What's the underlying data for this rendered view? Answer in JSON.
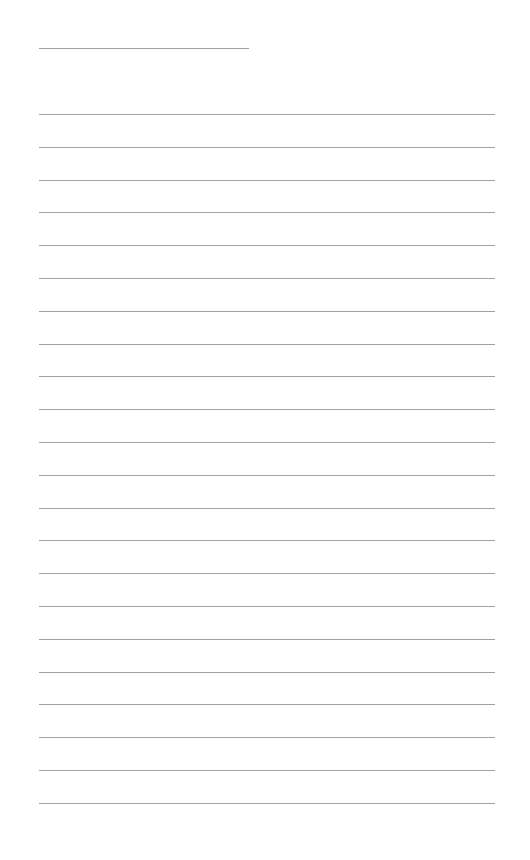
{
  "page": {
    "type": "lined-paper",
    "background_color": "#ffffff",
    "line_color": "#a0a0a0",
    "header_line": {
      "x": 39,
      "y": 48,
      "width": 210
    },
    "ruled_lines": {
      "x": 39,
      "width": 456,
      "first_y": 114,
      "spacing": 32.8,
      "count": 22
    }
  }
}
